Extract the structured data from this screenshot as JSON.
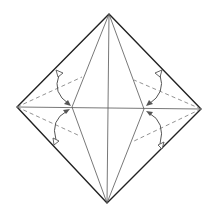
{
  "diagram": {
    "type": "origami-fold-diagram",
    "colors": {
      "outline": "#222222",
      "crease": "#555555",
      "dashed_fold": "#777777",
      "background": "#ffffff"
    },
    "shapes": {
      "outer_diamond": [
        [
          109,
          14
        ],
        [
          201,
          109
        ],
        [
          107,
          203
        ],
        [
          17,
          107
        ]
      ],
      "inner_kite": [
        [
          109,
          14
        ],
        [
          144,
          109
        ],
        [
          107,
          203
        ],
        [
          72,
          107
        ]
      ],
      "horizontal_crease": [
        [
          17,
          107
        ],
        [
          201,
          109
        ]
      ],
      "vertical_crease": [
        [
          109,
          14
        ],
        [
          107,
          203
        ]
      ]
    },
    "dashed_valley_folds": [
      {
        "name": "left-upper",
        "from": [
          17,
          107
        ],
        "to": [
          82,
          77
        ]
      },
      {
        "name": "left-lower",
        "from": [
          17,
          107
        ],
        "to": [
          80,
          136
        ]
      },
      {
        "name": "right-upper",
        "from": [
          201,
          109
        ],
        "to": [
          134,
          80
        ]
      },
      {
        "name": "right-lower",
        "from": [
          201,
          109
        ],
        "to": [
          132,
          142
        ]
      }
    ],
    "fold_arrows": [
      {
        "name": "left-upper",
        "start": [
          59,
          72
        ],
        "end": [
          70,
          105
        ]
      },
      {
        "name": "left-lower",
        "start": [
          55,
          142
        ],
        "end": [
          68,
          110
        ]
      },
      {
        "name": "right-upper",
        "start": [
          160,
          72
        ],
        "end": [
          148,
          105
        ]
      },
      {
        "name": "right-lower",
        "start": [
          160,
          146
        ],
        "end": [
          148,
          113
        ]
      }
    ]
  }
}
